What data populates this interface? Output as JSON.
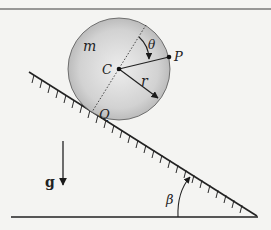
{
  "figure": {
    "colors": {
      "background": "#f4f4f2",
      "line": "#2a2a2a",
      "disk_center": "#ececec",
      "disk_edge": "#b4b4b4"
    },
    "labels": {
      "mass": "m",
      "center": "C",
      "point": "P",
      "contact": "Q",
      "radius": "r",
      "angle_theta": "θ",
      "angle_beta": "β",
      "gravity": "g"
    },
    "geometry": {
      "disk_center": [
        119,
        69
      ],
      "disk_radius": 51,
      "incline_start": [
        29,
        72
      ],
      "incline_end": [
        257,
        216
      ],
      "ground_y": 217,
      "ground_x_range": [
        11,
        258
      ]
    }
  }
}
